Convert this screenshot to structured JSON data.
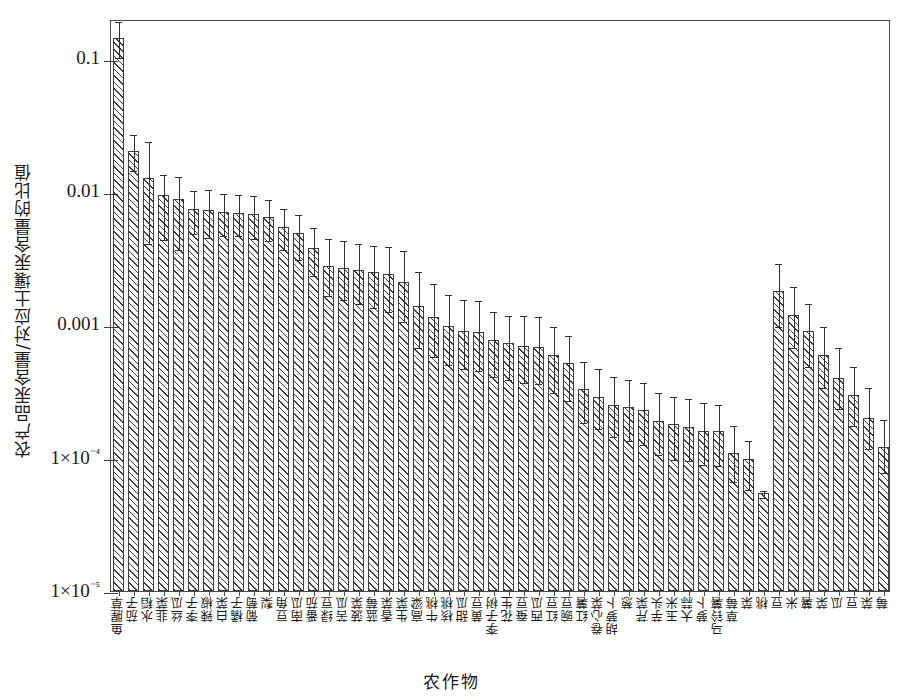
{
  "chart_data": {
    "type": "bar",
    "title": "",
    "xlabel": "农作物",
    "ylabel": "农产品汞含量/对应土壤汞含量的比值",
    "yscale": "log",
    "ylim": [
      1e-05,
      0.2
    ],
    "grid": false,
    "legend": "none",
    "ytick_labels": [
      "0.1",
      "0.01",
      "0.001",
      "1×10⁻⁴",
      "1×10⁻⁵"
    ],
    "ytick_values": [
      0.1,
      0.01,
      0.001,
      0.0001,
      1e-05
    ],
    "categories": [
      "鱼腥草",
      "茄子",
      "水稻",
      "韭菜",
      "丝瓜",
      "李子",
      "辣椒",
      "白菜",
      "橘子",
      "葡萄",
      "梨",
      "豆角",
      "南瓜",
      "番茄",
      "绿豆",
      "苦瓜",
      "菠菜",
      "蓝莓",
      "香菜",
      "生菜",
      "高粱",
      "牛桃",
      "核桃",
      "甜瓜",
      "黄豆",
      "李子树",
      "花生",
      "蚕豆",
      "西瓜",
      "红豆",
      "豌豆",
      "红薯",
      "卷心菜",
      "胡萝卜",
      "葱",
      "芹菜",
      "芋头",
      "玉米",
      "大蒜",
      "萝卜",
      "马铃薯",
      "草莓",
      "菜",
      "桃",
      "豆",
      "米",
      "薯",
      "菜",
      "瓜",
      "豆",
      "菜",
      "莓"
    ],
    "values": [
      0.145,
      0.0205,
      0.0128,
      0.0095,
      0.0088,
      0.0074,
      0.0073,
      0.0071,
      0.007,
      0.0068,
      0.0065,
      0.0055,
      0.0049,
      0.0038,
      0.0028,
      0.0027,
      0.0026,
      0.0025,
      0.0024,
      0.0021,
      0.0014,
      0.00115,
      0.00098,
      0.0009,
      0.00088,
      0.00077,
      0.00073,
      0.0007,
      0.00068,
      0.0006,
      0.00052,
      0.00033,
      0.00029,
      0.00025,
      0.00024,
      0.00023,
      0.00019,
      0.00018,
      0.00017,
      0.00016,
      0.00016,
      0.00011,
      9.8e-05,
      5.5e-05,
      0.0018,
      0.0012,
      0.0009,
      0.0006,
      0.0004,
      0.0003,
      0.0002,
      0.00012
    ],
    "err_upper": [
      0.195,
      0.028,
      0.0245,
      0.014,
      0.0135,
      0.0105,
      0.0108,
      0.01,
      0.0098,
      0.0096,
      0.009,
      0.0077,
      0.007,
      0.0056,
      0.0046,
      0.0044,
      0.0042,
      0.0041,
      0.004,
      0.0037,
      0.0026,
      0.0021,
      0.00175,
      0.0016,
      0.00158,
      0.0013,
      0.00122,
      0.0012,
      0.00118,
      0.001,
      0.00086,
      0.00055,
      0.00048,
      0.00042,
      0.0004,
      0.00038,
      0.00032,
      0.0003,
      0.00029,
      0.00027,
      0.00026,
      0.00018,
      0.00014,
      5.8e-05,
      0.003,
      0.002,
      0.0015,
      0.001,
      0.0007,
      0.0005,
      0.00035,
      0.0002
    ],
    "err_lower": [
      0.105,
      0.015,
      0.0042,
      0.0045,
      0.0038,
      0.005,
      0.0047,
      0.0048,
      0.0048,
      0.0046,
      0.0044,
      0.0038,
      0.0032,
      0.0024,
      0.0017,
      0.0016,
      0.0015,
      0.0014,
      0.0013,
      0.0011,
      0.0007,
      0.0006,
      0.00052,
      0.00048,
      0.00047,
      0.00042,
      0.0004,
      0.00038,
      0.00037,
      0.00032,
      0.00028,
      0.00019,
      0.00017,
      0.00015,
      0.00014,
      0.00013,
      0.00011,
      0.0001,
      9.8e-05,
      9.2e-05,
      9e-05,
      6.8e-05,
      6e-05,
      5.2e-05,
      0.001,
      0.0007,
      0.0005,
      0.00035,
      0.00024,
      0.00018,
      0.00012,
      8e-05
    ]
  }
}
